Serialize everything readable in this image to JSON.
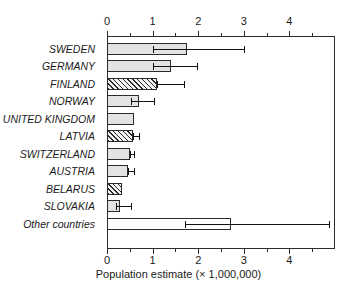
{
  "chart_data": {
    "type": "bar",
    "orientation": "horizontal",
    "title": "",
    "xlabel": "Population estimate (× 1,000,000)",
    "ylabel": "",
    "xlim": [
      0,
      5.0
    ],
    "xticks": [
      0,
      1,
      2,
      3,
      4
    ],
    "xticklabels": [
      "0",
      "1",
      "2",
      "3",
      "4"
    ],
    "xminor_step": 0.5,
    "grid": false,
    "legend": null,
    "axis_positions": [
      "top",
      "bottom"
    ],
    "categories": [
      "SWEDEN",
      "GERMANY",
      "FINLAND",
      "NORWAY",
      "UNITED KINGDOM",
      "LATVIA",
      "SWITZERLAND",
      "AUSTRIA",
      "BELARUS",
      "SLOVAKIA",
      "Other countries"
    ],
    "values": [
      1.75,
      1.4,
      1.1,
      0.7,
      0.6,
      0.58,
      0.5,
      0.47,
      0.33,
      0.28,
      2.72
    ],
    "fills": [
      "solid",
      "solid",
      "hatch",
      "solid",
      "solid",
      "hatch",
      "solid",
      "solid",
      "hatch",
      "solid",
      "none"
    ],
    "error_bars": [
      {
        "low": 1.0,
        "high": 3.0
      },
      {
        "low": 1.0,
        "high": 1.98
      },
      {
        "low": 1.1,
        "high": 1.68
      },
      {
        "low": 0.52,
        "high": 1.02
      },
      null,
      {
        "low": 0.58,
        "high": 0.7
      },
      {
        "low": 0.5,
        "high": 0.6
      },
      {
        "low": 0.47,
        "high": 0.59
      },
      null,
      {
        "low": 0.2,
        "high": 0.53
      },
      {
        "low": 1.72,
        "high": 4.87
      }
    ]
  },
  "axis": {
    "x_title": "Population estimate (× 1,000,000)"
  },
  "colors": {
    "frame": "#2b2b2b",
    "bar_solid": "#e3e3e3",
    "bar_hatch_bg": "#f2f2f2",
    "bar_none": "#ffffff",
    "error": "#111111",
    "text": "#1a1a1a",
    "background": "#ffffff"
  }
}
